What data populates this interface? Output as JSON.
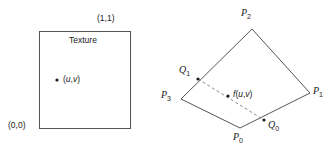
{
  "figure": {
    "width": 332,
    "height": 154,
    "background": "#ffffff",
    "stroke_color": "#555555",
    "text_color": "#1a1a1a",
    "dash_color": "#8a8a8a"
  },
  "texture_panel": {
    "title": "Texture",
    "corner_top_right": "(1,1)",
    "corner_bottom_left": "(0,0)",
    "sample_point_label_open": "(",
    "sample_u": "u",
    "sample_comma": ",",
    "sample_v": "v",
    "sample_point_label_close": ")",
    "square": {
      "x": 39,
      "y": 31,
      "w": 91,
      "h": 97
    },
    "sample_dot": {
      "x": 57,
      "y": 80
    }
  },
  "quad_panel": {
    "vertices": [
      {
        "name": "P0",
        "letter": "P",
        "sub": "0",
        "x": 240,
        "y": 128,
        "label_x": 234,
        "label_y": 133
      },
      {
        "name": "P1",
        "letter": "P",
        "sub": "1",
        "x": 310,
        "y": 93,
        "label_x": 313,
        "label_y": 88
      },
      {
        "name": "P2",
        "letter": "P",
        "sub": "2",
        "x": 252,
        "y": 29,
        "label_x": 241,
        "label_y": 8
      },
      {
        "name": "P3",
        "letter": "P",
        "sub": "3",
        "x": 181,
        "y": 99,
        "label_x": 162,
        "label_y": 90
      }
    ],
    "edge_points": [
      {
        "name": "Q0",
        "letter": "Q",
        "sub": "0",
        "x": 264,
        "y": 120,
        "label_x": 268,
        "label_y": 122
      },
      {
        "name": "Q1",
        "letter": "Q",
        "sub": "1",
        "x": 198,
        "y": 79,
        "label_x": 180,
        "label_y": 66
      }
    ],
    "interp_point": {
      "x": 228,
      "y": 96,
      "label_x": 233,
      "label_y": 91,
      "f": "f",
      "open": "(",
      "u": "u",
      "comma": ",",
      "v": "v",
      "close": ")"
    }
  }
}
